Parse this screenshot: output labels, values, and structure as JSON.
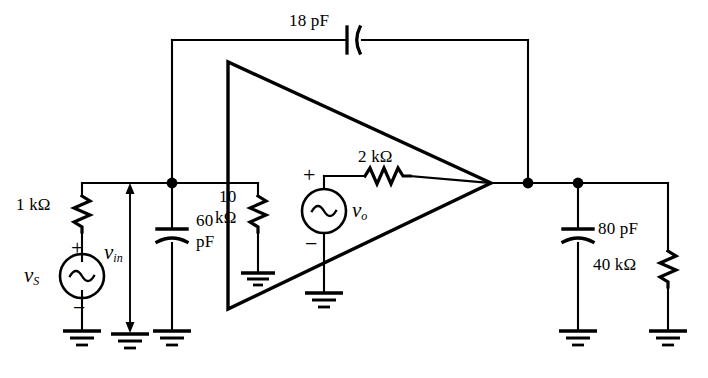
{
  "figure": {
    "kind": "circuit-schematic",
    "title": "",
    "stroke_color": "#000000",
    "background_color": "#ffffff"
  },
  "components": {
    "r_source": {
      "label": "1 kΩ",
      "type": "resistor",
      "orientation": "vertical"
    },
    "r_feedback_in": {
      "label_line1": "10",
      "label_line2": "kΩ",
      "type": "resistor",
      "orientation": "vertical"
    },
    "r_out_series": {
      "label": "2 kΩ",
      "type": "resistor",
      "orientation": "horizontal"
    },
    "r_load": {
      "label": "40 kΩ",
      "type": "resistor",
      "orientation": "vertical"
    },
    "c_feedback": {
      "label": "18 pF",
      "type": "capacitor",
      "orientation": "horizontal"
    },
    "c_input": {
      "label_line1": "60",
      "label_line2": "pF",
      "type": "capacitor",
      "orientation": "vertical"
    },
    "c_output": {
      "label": "80 pF",
      "type": "capacitor",
      "orientation": "vertical"
    },
    "vs_source": {
      "label": "vS",
      "label_base": "v",
      "label_sub": "S",
      "type": "ac-source",
      "plus": "+",
      "minus": "−"
    },
    "vo_source": {
      "label": "vo",
      "label_base": "v",
      "label_sub": "o",
      "type": "ac-source",
      "plus": "+",
      "minus": "−"
    },
    "v_in_arrow": {
      "label": "vin",
      "label_base": "v",
      "label_sub": "in",
      "type": "voltage-arrow"
    },
    "opamp": {
      "type": "amplifier-triangle"
    }
  },
  "grounds": [
    {
      "name": "ground-source"
    },
    {
      "name": "ground-vin-arrow"
    },
    {
      "name": "ground-input-cap"
    },
    {
      "name": "ground-10k"
    },
    {
      "name": "ground-vo"
    },
    {
      "name": "ground-output-cap"
    },
    {
      "name": "ground-load"
    }
  ],
  "nodes": [
    {
      "name": "node-input"
    },
    {
      "name": "node-output"
    },
    {
      "name": "node-output-branch"
    }
  ]
}
